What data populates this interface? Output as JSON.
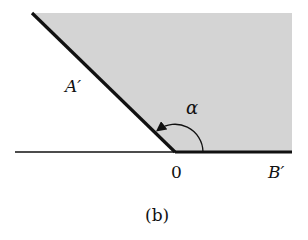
{
  "figure": {
    "caption": "(b)",
    "labels": {
      "ray_a": "A′",
      "ray_b": "B′",
      "origin": "0",
      "angle": "α"
    },
    "colors": {
      "region_fill": "#d4d4d4",
      "line": "#111111",
      "background": "#ffffff"
    },
    "geometry": {
      "origin": [
        175,
        152
      ],
      "ray_a_end": [
        32,
        13
      ],
      "ray_b_end": [
        292,
        152
      ],
      "axis_left_end": [
        15,
        152
      ],
      "region_top": 13,
      "region_right": 292
    }
  }
}
